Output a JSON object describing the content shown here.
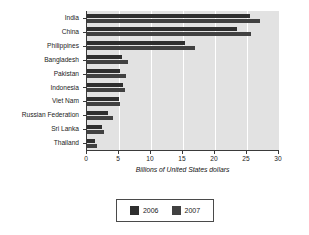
{
  "chart_data": {
    "type": "bar",
    "orientation": "horizontal",
    "title": "",
    "xlabel": "Billions of United States dollars",
    "ylabel": "",
    "xlim": [
      0,
      30
    ],
    "xticks": [
      0,
      5,
      10,
      15,
      20,
      25,
      30
    ],
    "xtick_labels": [
      "0",
      "5",
      "10",
      "15",
      "20",
      "25",
      "30"
    ],
    "grid": true,
    "grid_axis": "x",
    "legend_position": "bottom",
    "categories": [
      "India",
      "China",
      "Philippines",
      "Bangladesh",
      "Pakistan",
      "Indonesia",
      "Viet Nam",
      "Russian Federation",
      "Sri Lanka",
      "Thailand"
    ],
    "series": [
      {
        "name": "2006",
        "color": "#2f2f2f",
        "values": [
          25.4,
          23.4,
          15.3,
          5.5,
          5.1,
          5.7,
          5.0,
          3.3,
          2.3,
          1.3
        ]
      },
      {
        "name": "2007",
        "color": "#414141",
        "values": [
          27.0,
          25.7,
          16.9,
          6.4,
          6.1,
          6.0,
          5.2,
          4.1,
          2.7,
          1.6
        ]
      }
    ],
    "plot_background": "#e2e2e2",
    "gridline_color": "#ffffff",
    "axis_color": "#3a3a3a"
  },
  "legend": {
    "entries": [
      {
        "label": "2006"
      },
      {
        "label": "2007"
      }
    ]
  }
}
